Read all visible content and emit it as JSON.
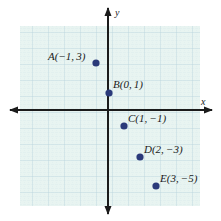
{
  "figure": {
    "kind": "coordinate-plane",
    "background_color": "#ffffff",
    "grid_fill": "#e8f4f1",
    "grid_minor_color": "#cfe3e6",
    "grid_major_color": "#b9d6dc",
    "axis_color": "#1b1b1b",
    "point_color": "#2b3a7a",
    "label_color": "#1a1a1a"
  },
  "axes": {
    "x_label": "x",
    "y_label": "y",
    "x_range": [
      -6,
      6
    ],
    "y_range": [
      -6,
      6
    ],
    "grid": true,
    "tick_labels_shown": false,
    "origin_px": [
      108,
      110
    ],
    "unit_px": 16
  },
  "chart_data": {
    "type": "scatter",
    "title": "",
    "xlabel": "x",
    "ylabel": "y",
    "xlim": [
      -6,
      6
    ],
    "ylim": [
      -6,
      6
    ],
    "grid": true,
    "legend": "none",
    "point_labels": [
      "A(−1, 3)",
      "B(0, 1)",
      "C(1, −1)",
      "D(2, −3)",
      "E(3, −5)"
    ],
    "series": [
      {
        "name": "points",
        "points": [
          {
            "name": "A",
            "x": -1,
            "y": 3,
            "label": "A(−1, 3)",
            "px": 96,
            "py": 63,
            "label_x": 48,
            "label_y": 60,
            "anchor": "start"
          },
          {
            "name": "B",
            "x": 0,
            "y": 1,
            "label": "B(0, 1)",
            "px": 109,
            "py": 93,
            "label_x": 113,
            "label_y": 88,
            "anchor": "start"
          },
          {
            "name": "C",
            "x": 1,
            "y": -1,
            "label": "C(1, −1)",
            "px": 124,
            "py": 126,
            "label_x": 128,
            "label_y": 122,
            "anchor": "start"
          },
          {
            "name": "D",
            "x": 2,
            "y": -3,
            "label": "D(2, −3)",
            "px": 140,
            "py": 157,
            "label_x": 144,
            "label_y": 153,
            "anchor": "start"
          },
          {
            "name": "E",
            "x": 3,
            "y": -5,
            "label": "E(3, −5)",
            "px": 156,
            "py": 186,
            "label_x": 160,
            "label_y": 182,
            "anchor": "start"
          }
        ]
      }
    ]
  }
}
